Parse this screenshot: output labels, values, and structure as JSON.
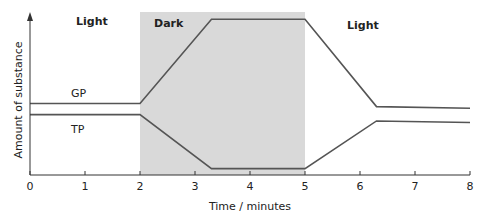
{
  "chart_data": {
    "type": "line",
    "title": "",
    "xlabel": "Time / minutes",
    "ylabel": "Amount of substance",
    "xlim": [
      0,
      8
    ],
    "x_ticks": [
      0,
      1,
      2,
      3,
      4,
      5,
      6,
      7,
      8
    ],
    "y_ticks": [],
    "grid": false,
    "legend": "inline labels",
    "regions": [
      {
        "label": "Light",
        "x_start": 0,
        "x_end": 2,
        "shaded": false
      },
      {
        "label": "Dark",
        "x_start": 2,
        "x_end": 5,
        "shaded": true,
        "color": "#d9d9d9"
      },
      {
        "label": "Light",
        "x_start": 5,
        "x_end": 8,
        "shaded": false
      }
    ],
    "series": [
      {
        "name": "GP",
        "x": [
          0,
          2,
          3.3,
          5,
          6.3,
          8
        ],
        "values": [
          0.45,
          0.45,
          0.98,
          0.98,
          0.43,
          0.42
        ],
        "color": "#555555"
      },
      {
        "name": "TP",
        "x": [
          0,
          2,
          3.3,
          5,
          6.3,
          8
        ],
        "values": [
          0.38,
          0.38,
          0.04,
          0.04,
          0.34,
          0.33
        ],
        "color": "#555555"
      }
    ]
  },
  "labels": {
    "xlabel": "Time / minutes",
    "ylabel": "Amount of substance",
    "region_light_1": "Light",
    "region_dark": "Dark",
    "region_light_2": "Light",
    "series_gp": "GP",
    "series_tp": "TP"
  }
}
